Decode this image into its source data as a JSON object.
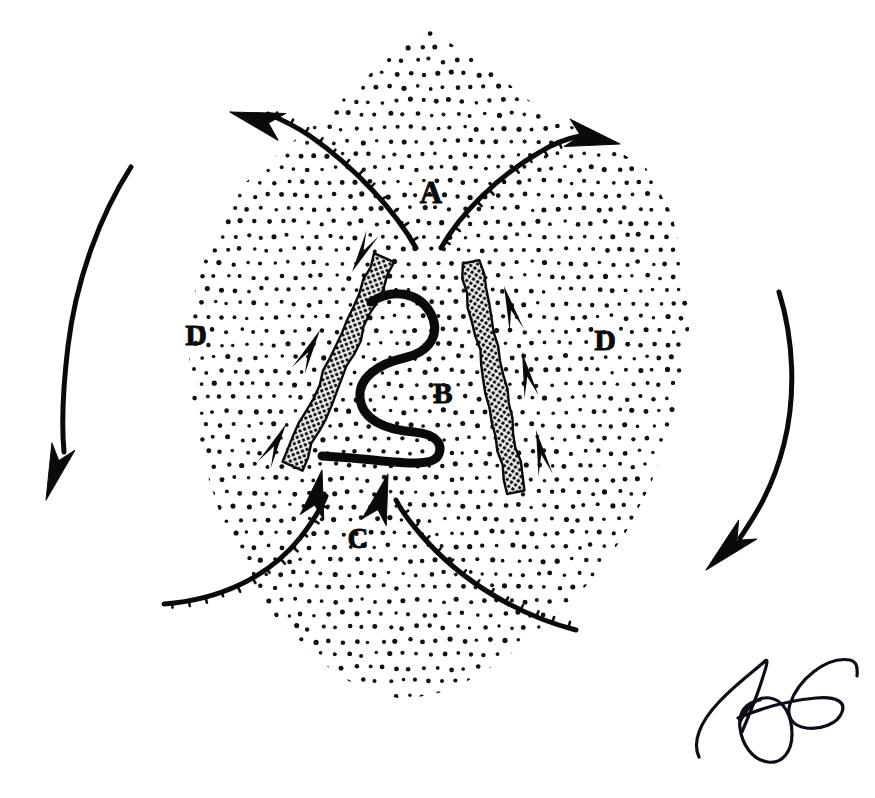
{
  "figure": {
    "background_color": "#ffffff",
    "ink_color": "#0a0a0a",
    "width": 875,
    "height": 798
  },
  "labels": [
    {
      "id": "A",
      "text": "A",
      "x": 431,
      "y": 196,
      "font_size": 31,
      "description": "label-A-upper-midline"
    },
    {
      "id": "B",
      "text": "B",
      "x": 443,
      "y": 396,
      "font_size": 29,
      "description": "label-B-central-serpentine"
    },
    {
      "id": "C",
      "text": "C",
      "x": 358,
      "y": 541,
      "font_size": 29,
      "description": "label-C-lower-midline"
    },
    {
      "id": "D-left",
      "text": "D",
      "x": 196,
      "y": 338,
      "font_size": 30,
      "description": "label-D-left-field"
    },
    {
      "id": "D-right",
      "text": "D",
      "x": 605,
      "y": 343,
      "font_size": 30,
      "description": "label-D-right-field"
    }
  ],
  "stipple_region": {
    "name": "stippled-blob",
    "dot_color": "#111111",
    "dot_radius": 2.1,
    "spacing": 13.5,
    "jitter": 2.0,
    "outline_path": "M 430 30 L 492 70 L 543 112 L 600 140 L 646 168 L 672 214 L 684 268 L 690 322 L 682 378 L 670 432 L 650 486 L 624 536 L 590 582 L 548 624 L 500 662 L 452 690 L 404 700 L 356 686 L 312 656 L 276 618 L 246 572 L 222 520 L 204 464 L 192 404 L 188 344 L 196 284 L 214 230 L 246 182 L 288 146 L 330 110 L 372 72 L 404 44 Z",
    "holes": [
      {
        "name": "upper-left-notch",
        "path": "M 188 344 L 196 284 L 214 230 L 246 182 L 200 190 L 178 246 L 176 300 Z"
      }
    ]
  },
  "hatched_bands": [
    {
      "name": "hatched-band-left",
      "description": "thick cross-hatched diagonal bar, tilted top-right to bottom-left",
      "x1": 385,
      "y1": 258,
      "x2": 292,
      "y2": 466,
      "width": 20,
      "fill": "cross-hatch"
    },
    {
      "name": "hatched-band-right",
      "description": "thick cross-hatched near-vertical bar, tilted top-left to bottom-right",
      "x1": 470,
      "y1": 262,
      "x2": 517,
      "y2": 492,
      "width": 19,
      "fill": "cross-hatch"
    }
  ],
  "serpentine": {
    "name": "serpentine-structure-B",
    "description": "S-shaped meandering tube between the two hatched bands",
    "path": "M 371 302 C 392 288 418 292 430 312 C 442 334 430 352 404 358 C 378 364 358 378 360 398 C 362 420 386 430 414 432 C 436 434 444 444 438 456 C 430 468 398 462 352 458 L 322 456",
    "stroke_width": 9
  },
  "arrows": [
    {
      "name": "arrow-upper-left-outflow",
      "description": "curve from centre rising to upper-left with large solid arrowhead",
      "path": "M 416 248 C 396 212 356 168 310 136 C 292 124 278 118 268 114",
      "head": {
        "x": 230,
        "y": 112,
        "angle": 196,
        "length": 54,
        "width": 28
      },
      "stroke_width": 5,
      "serrated": true
    },
    {
      "name": "arrow-upper-right-outflow",
      "description": "curve from centre rising to upper-right with large solid arrowhead",
      "path": "M 441 248 C 460 214 498 176 540 152 C 556 142 570 138 580 136",
      "head": {
        "x": 620,
        "y": 144,
        "angle": 12,
        "length": 54,
        "width": 28
      },
      "stroke_width": 5,
      "serrated": true
    },
    {
      "name": "arrow-lower-left-inflow",
      "description": "curve from lower-left rim sweeping up to centre, arrowhead pointing up",
      "path": "M 164 604 C 218 600 268 578 300 538 C 314 520 322 506 326 496",
      "head": {
        "x": 322,
        "y": 470,
        "angle": -78,
        "length": 48,
        "width": 24
      },
      "stroke_width": 5,
      "serrated": true
    },
    {
      "name": "arrow-lower-right-inflow",
      "description": "curve from lower-right rim sweeping up to centre, arrowhead pointing up",
      "path": "M 576 630 C 520 616 462 582 422 536 C 408 520 400 508 396 500",
      "head": {
        "x": 388,
        "y": 474,
        "angle": -74,
        "length": 50,
        "width": 25
      },
      "stroke_width": 5,
      "serrated": true
    },
    {
      "name": "arrow-outer-left-rotation",
      "description": "long smooth curve outside blob on left, arrowhead pointing down",
      "path": "M 131 167 C 100 215 76 280 68 346 C 62 396 62 430 64 452",
      "head": {
        "x": 46,
        "y": 500,
        "angle": 108,
        "length": 56,
        "width": 24
      },
      "stroke_width": 5,
      "serrated": false
    },
    {
      "name": "arrow-outer-right-rotation",
      "description": "long smooth curve outside blob on right, arrowhead pointing down-left",
      "path": "M 779 292 C 794 340 796 396 784 444 C 772 492 752 520 740 538",
      "head": {
        "x": 706,
        "y": 570,
        "angle": 136,
        "length": 58,
        "width": 26
      },
      "stroke_width": 5,
      "serrated": false
    }
  ],
  "darts": [
    {
      "name": "dart-left-band-top",
      "x": 352,
      "y": 272,
      "angle": -62,
      "length": 44,
      "width": 15
    },
    {
      "name": "dart-left-band-mid",
      "x": 320,
      "y": 330,
      "angle": 118,
      "length": 46,
      "width": 16
    },
    {
      "name": "dart-left-band-low",
      "x": 286,
      "y": 424,
      "angle": 118,
      "length": 46,
      "width": 16
    },
    {
      "name": "dart-right-band-top",
      "x": 504,
      "y": 286,
      "angle": 74,
      "length": 46,
      "width": 16
    },
    {
      "name": "dart-right-band-mid",
      "x": 522,
      "y": 352,
      "angle": 78,
      "length": 46,
      "width": 16
    },
    {
      "name": "dart-right-band-low",
      "x": 536,
      "y": 430,
      "angle": 78,
      "length": 46,
      "width": 16
    }
  ],
  "signature": {
    "name": "artist-signature",
    "description": "handwritten flourish in lower-right corner",
    "paths": [
      "M 699 757 C 692 742 700 722 719 702 C 738 682 758 668 764 662 C 770 656 766 668 760 686 C 754 704 746 722 742 732",
      "M 740 722 C 748 706 758 696 770 698 C 784 700 792 716 792 734 C 792 752 782 764 768 762 C 752 760 742 744 740 728 C 738 712 746 702 760 700",
      "M 738 718 C 762 708 792 700 816 698 C 836 696 846 702 842 712 C 838 724 820 730 806 728 C 792 726 786 716 790 704 C 798 680 826 656 850 660 C 856 661 858 666 857 676"
    ],
    "stroke_width": 3.2
  }
}
